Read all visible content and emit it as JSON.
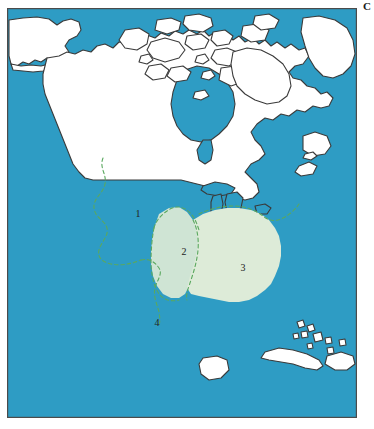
{
  "figure": {
    "panel_letter": "C",
    "type": "distribution-map"
  },
  "map": {
    "frame": {
      "border_color": "#4b4b4b",
      "x": 7,
      "y": 8,
      "width": 350,
      "height": 410
    },
    "colors": {
      "ocean": "#2e9cc4",
      "land": "#ffffff",
      "coastline": "#3a3a3a",
      "region_2_fill": "#cfe4d4",
      "region_3_fill": "#ddebd8",
      "region_boundary": "#5aa85f",
      "label_text": "#222222"
    },
    "region_labels": [
      {
        "id": "1",
        "text": "1",
        "x": 131,
        "y": 209,
        "description": "northern / western unshaded region"
      },
      {
        "id": "2",
        "text": "2",
        "x": 177,
        "y": 247,
        "description": "central shaded region"
      },
      {
        "id": "3",
        "text": "3",
        "x": 236,
        "y": 263,
        "description": "southeastern shaded region"
      },
      {
        "id": "4",
        "text": "4",
        "x": 150,
        "y": 318,
        "description": "southern Texas / Mexico boundary region"
      }
    ],
    "features": {
      "great_lakes": "Great Lakes drawn in ocean blue",
      "caribbean": "Cuba, Hispaniola and Bahamas islands shown in white",
      "hudson_bay": "Hudson Bay shown in ocean blue",
      "arctic_archipelago": "Canadian Arctic islands shown in white"
    }
  }
}
